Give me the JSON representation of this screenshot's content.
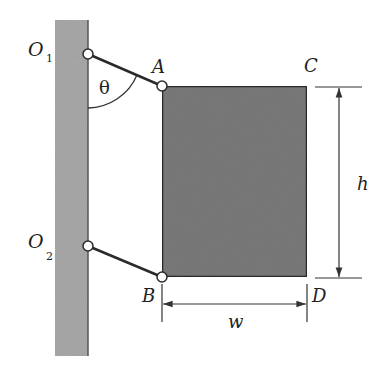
{
  "diagram": {
    "type": "mechanism-figure",
    "colors": {
      "wall": "#a9a9a9",
      "wall_edge": "#555555",
      "plate": "#7a7a7a",
      "plate_edge": "#2a2a2a",
      "link": "#2a2a2a",
      "line": "#333333"
    },
    "labels": {
      "O1": {
        "main": "O",
        "sub": "1"
      },
      "O2": {
        "main": "O",
        "sub": "2"
      },
      "A": "A",
      "B": "B",
      "C": "C",
      "D": "D",
      "theta": "θ",
      "h": "h",
      "w": "w"
    },
    "points": {
      "O1": [
        88,
        54
      ],
      "O2": [
        88,
        246
      ],
      "A": [
        162,
        86
      ],
      "B": [
        162,
        277
      ],
      "C": [
        307,
        86
      ],
      "D": [
        307,
        277
      ]
    }
  }
}
